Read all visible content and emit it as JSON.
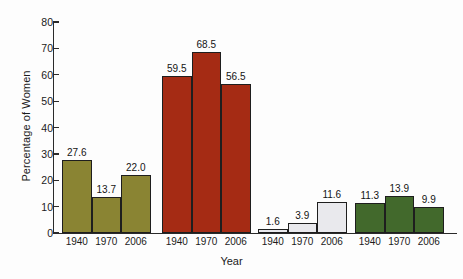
{
  "chart_data": {
    "type": "bar",
    "title": "",
    "xlabel": "Year",
    "ylabel": "Percentage of Women",
    "ylim": [
      0,
      80
    ],
    "yticks": [
      0,
      10,
      20,
      30,
      40,
      50,
      60,
      70,
      80
    ],
    "ytick_labels": [
      "0",
      "10",
      "20",
      "30",
      "40",
      "50",
      "60",
      "70",
      "80"
    ],
    "grid": false,
    "legend": "none",
    "categories": [
      "1940",
      "1970",
      "2006"
    ],
    "groups": [
      {
        "name": "group-1",
        "color": "#8a8433",
        "categories": [
          "1940",
          "1970",
          "2006"
        ],
        "values": [
          27.6,
          13.7,
          22.0
        ],
        "value_labels": [
          "27.6",
          "13.7",
          "22.0"
        ]
      },
      {
        "name": "group-2",
        "color": "#a52b14",
        "categories": [
          "1940",
          "1970",
          "2006"
        ],
        "values": [
          59.5,
          68.5,
          56.5
        ],
        "value_labels": [
          "59.5",
          "68.5",
          "56.5"
        ]
      },
      {
        "name": "group-3",
        "color": "#e9e9ed",
        "categories": [
          "1940",
          "1970",
          "2006"
        ],
        "values": [
          1.6,
          3.9,
          11.6
        ],
        "value_labels": [
          "1.6",
          "3.9",
          "11.6"
        ]
      },
      {
        "name": "group-4",
        "color": "#42692c",
        "categories": [
          "1940",
          "1970",
          "2006"
        ],
        "values": [
          11.3,
          13.9,
          9.9
        ],
        "value_labels": [
          "11.3",
          "13.9",
          "9.9"
        ]
      }
    ]
  },
  "axis": {
    "ylabel": "Percentage of Women",
    "xlabel": "Year"
  },
  "colors": {
    "olive": "#8a8433",
    "red": "#a52b14",
    "lightgray": "#e9e9ed",
    "green": "#42692c",
    "axis": "#2a2a2a",
    "text": "#1b1b1b",
    "background": "#fdfdfd"
  }
}
